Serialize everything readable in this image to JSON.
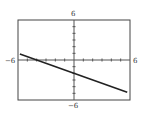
{
  "chart_data": {
    "type": "line",
    "title": "",
    "xlabel": "",
    "ylabel": "",
    "xlim": [
      -6,
      6
    ],
    "ylim": [
      -6,
      6
    ],
    "grid": false,
    "tick_step": 1,
    "tick_labels": {
      "xmin": "−6",
      "xmax": "6",
      "ymin": "−6",
      "ymax": "6"
    },
    "series": [
      {
        "name": "y = -0.5x - 2",
        "x": [
          -6,
          6
        ],
        "y": [
          1,
          -5
        ]
      }
    ],
    "colors": {
      "line": "#222222",
      "axis": "#555555",
      "frame": "#444444"
    }
  }
}
